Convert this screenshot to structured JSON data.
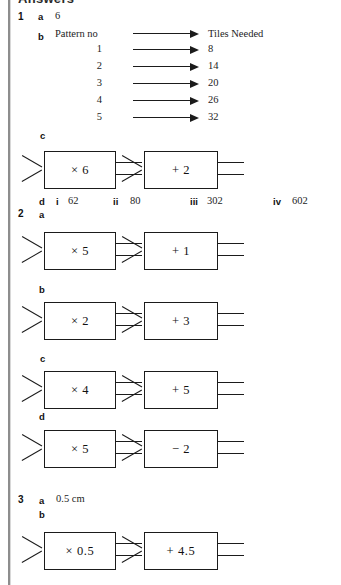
{
  "page": {
    "cut_off_heading": "Answers",
    "rule_color": "#8d8d8d",
    "ink_color": "#1b1b1b",
    "background": "#ffffff"
  },
  "questions": [
    {
      "number": "1",
      "parts": [
        {
          "label": "a",
          "answer": "6"
        },
        {
          "label": "b",
          "mapping_table": {
            "left_header": "Pattern no",
            "right_header": "Tiles Needed",
            "arrow": "right-arrow",
            "rows": [
              {
                "input": "1",
                "output": "8"
              },
              {
                "input": "2",
                "output": "14"
              },
              {
                "input": "3",
                "output": "20"
              },
              {
                "input": "4",
                "output": "26"
              },
              {
                "input": "5",
                "output": "32"
              }
            ]
          }
        },
        {
          "label": "c",
          "machines": [
            {
              "operation": "× 6"
            },
            {
              "operation": "+ 2"
            }
          ]
        },
        {
          "label": "d",
          "roman_answers": [
            {
              "numeral": "i",
              "value": "62"
            },
            {
              "numeral": "ii",
              "value": "80"
            },
            {
              "numeral": "iii",
              "value": "302"
            },
            {
              "numeral": "iv",
              "value": "602"
            }
          ]
        }
      ]
    },
    {
      "number": "2",
      "parts": [
        {
          "label": "a",
          "machines": [
            {
              "operation": "× 5"
            },
            {
              "operation": "+ 1"
            }
          ]
        },
        {
          "label": "b",
          "machines": [
            {
              "operation": "× 2"
            },
            {
              "operation": "+ 3"
            }
          ]
        },
        {
          "label": "c",
          "machines": [
            {
              "operation": "× 4"
            },
            {
              "operation": "+ 5"
            }
          ]
        },
        {
          "label": "d",
          "machines": [
            {
              "operation": "× 5"
            },
            {
              "operation": "− 2"
            }
          ]
        }
      ]
    },
    {
      "number": "3",
      "parts": [
        {
          "label": "a",
          "answer": "0.5 cm"
        },
        {
          "label": "b",
          "machines": [
            {
              "operation": "× 0.5"
            },
            {
              "operation": "+ 4.5"
            }
          ]
        }
      ]
    }
  ]
}
